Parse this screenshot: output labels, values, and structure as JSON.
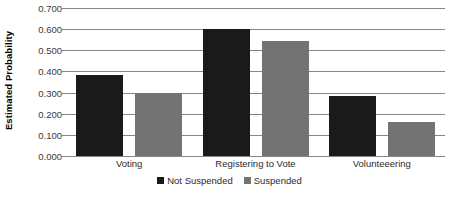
{
  "chart_data": {
    "type": "bar",
    "title": "",
    "xlabel": "",
    "ylabel": "Estimated Probability",
    "ylim": [
      0.0,
      0.7
    ],
    "ytick_step": 0.1,
    "ytick_labels": [
      "0.000",
      "0.100",
      "0.200",
      "0.300",
      "0.400",
      "0.500",
      "0.600",
      "0.700"
    ],
    "ytick_values": [
      0.0,
      0.1,
      0.2,
      0.3,
      0.4,
      0.5,
      0.6,
      0.7
    ],
    "grid": "horizontal",
    "legend_position": "bottom-center",
    "categories": [
      "Voting",
      "Registering to Vote",
      "Volunteeering"
    ],
    "series": [
      {
        "name": "Not Suspended",
        "color": "#1a1a1a",
        "values": [
          0.385,
          0.6,
          0.285
        ]
      },
      {
        "name": "Suspended",
        "color": "#737373",
        "values": [
          0.3,
          0.545,
          0.16
        ]
      }
    ]
  },
  "style": {
    "background": "#ffffff",
    "gridline_color": "#868686",
    "axis_text_color": "#2b2b2b"
  }
}
